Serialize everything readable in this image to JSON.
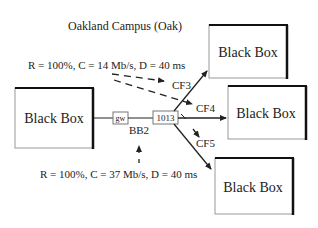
{
  "campus_label": "Oakland Campus (Oak)",
  "boxes": {
    "left": "Black Box",
    "right_top": "Black Box",
    "right_middle": "Black Box",
    "right_bottom": "Black Box"
  },
  "nodes": {
    "gateway": "gw",
    "router": "1013",
    "backbone": "BB2"
  },
  "flows": {
    "cf3": "CF3",
    "cf4": "CF4",
    "cf5": "CF5"
  },
  "annotations": {
    "top": "R = 100%, C = 14 Mb/s, D = 40 ms",
    "bottom": "R = 100%, C = 37 Mb/s, D = 40 ms"
  },
  "colors": {
    "line": "#222222",
    "box_border": "#888888",
    "box_shadow": "#111111"
  }
}
